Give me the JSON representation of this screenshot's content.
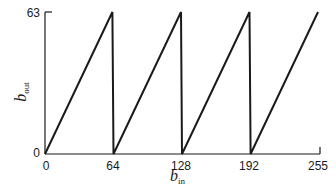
{
  "chart_data": {
    "type": "line",
    "title": "",
    "xlabel": "b_in",
    "ylabel": "b_out",
    "xlabel_main": "b",
    "xlabel_sub": "in",
    "ylabel_main": "b",
    "ylabel_sub": "out",
    "xlim": [
      0,
      255
    ],
    "ylim": [
      0,
      63
    ],
    "x_ticks": [
      "0",
      "64",
      "128",
      "192",
      "255"
    ],
    "y_ticks": [
      "0",
      "63"
    ],
    "grid": false,
    "legend": null,
    "series": [
      {
        "name": "sawtooth",
        "x": [
          0,
          63,
          64,
          127,
          128,
          191,
          192,
          255
        ],
        "y": [
          0,
          63,
          0,
          63,
          0,
          63,
          0,
          63
        ]
      }
    ]
  }
}
